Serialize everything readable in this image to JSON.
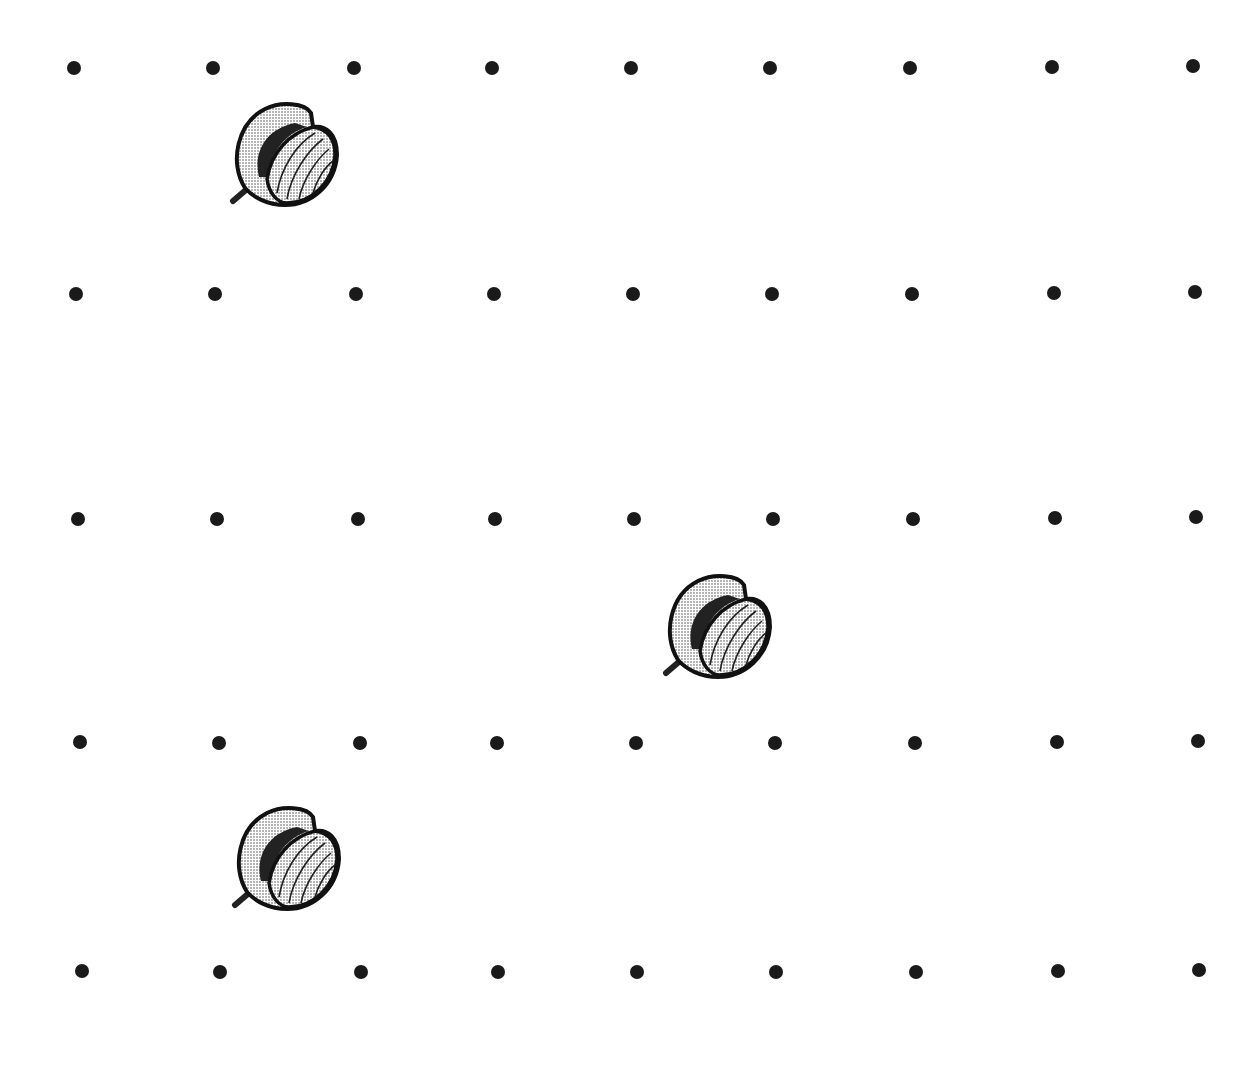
{
  "grid": {
    "rows_y": [
      [
        68,
        68,
        68,
        68,
        68,
        68,
        68,
        67,
        66
      ],
      [
        294,
        294,
        294,
        294,
        294,
        294,
        294,
        293,
        292
      ],
      [
        519,
        519,
        519,
        519,
        519,
        519,
        519,
        518,
        517
      ],
      [
        742,
        743,
        743,
        743,
        743,
        743,
        743,
        742,
        741
      ],
      [
        971,
        972,
        972,
        972,
        972,
        972,
        972,
        971,
        970
      ]
    ],
    "cols_x": [
      [
        74,
        213,
        354,
        492,
        631,
        770,
        910,
        1052,
        1193
      ],
      [
        76,
        215,
        356,
        494,
        633,
        772,
        912,
        1054,
        1195
      ],
      [
        78,
        217,
        358,
        495,
        634,
        773,
        913,
        1055,
        1196
      ],
      [
        80,
        219,
        360,
        497,
        636,
        775,
        915,
        1057,
        1198
      ],
      [
        82,
        220,
        361,
        498,
        637,
        776,
        916,
        1058,
        1199
      ]
    ],
    "dot_color": "#1a1a1a"
  },
  "nuts": [
    {
      "name": "nut-1",
      "x": 280,
      "y": 158
    },
    {
      "name": "nut-2",
      "x": 713,
      "y": 630
    },
    {
      "name": "nut-3",
      "x": 282,
      "y": 862
    }
  ]
}
